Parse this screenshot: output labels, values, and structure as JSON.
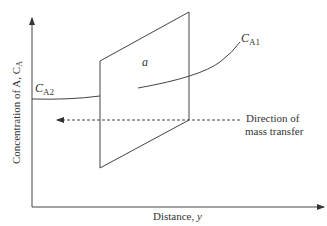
{
  "diagram": {
    "type": "mass-transfer-concentration-profile",
    "y_axis_label": "Concentration of A, C",
    "y_axis_label_sub": "A",
    "x_axis_label": "Distance, ",
    "x_axis_label_var": "y",
    "interface_label": "a",
    "curve_left": {
      "symbol": "C",
      "subscript": "A2"
    },
    "curve_right": {
      "symbol": "C",
      "subscript": "A1"
    },
    "direction_label_line1": "Direction of",
    "direction_label_line2": "mass transfer",
    "colors": {
      "line": "#444444",
      "text": "#333333",
      "background": "#ffffff"
    }
  }
}
